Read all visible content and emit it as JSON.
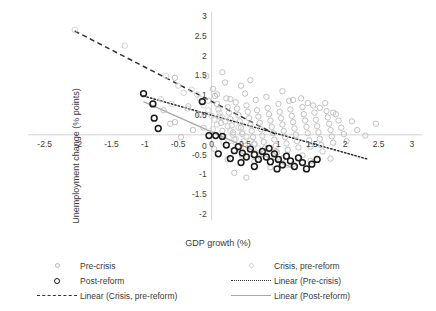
{
  "chart_data": {
    "type": "scatter",
    "title": "",
    "xlabel": "GDP growth (%)",
    "ylabel": "Unemployment change (% points)",
    "xlim": [
      -2.75,
      3.15
    ],
    "ylim": [
      -2.15,
      3.1
    ],
    "xticks": [
      -2.5,
      -2,
      -1.5,
      -1,
      -0.5,
      0,
      0.5,
      1,
      1.5,
      2,
      2.5,
      3
    ],
    "xticklabels": [
      "-2.5",
      "-2",
      "-1.5",
      "-1",
      "-0.5",
      "0",
      "0.5",
      "1",
      "1.5",
      "2",
      "2.5",
      "3"
    ],
    "yticks": [
      -2,
      -1.5,
      -1,
      -0.5,
      0,
      0.5,
      1,
      1.5,
      2,
      2.5,
      3
    ],
    "yticklabels": [
      "-2",
      "-1.5",
      "-1",
      "-0.5",
      "0",
      "0.5",
      "1",
      "1.5",
      "2",
      "2.5",
      "3"
    ],
    "grid": false,
    "legend_position": "below",
    "colors": {
      "pre_crisis": "#b7b7b7",
      "crisis_pre_reform": "#c9c9c9",
      "post_reform": "#1a1a1a",
      "line_crisis_pre_reform": "#333333",
      "line_pre_crisis": "#2b2b2b",
      "line_post_reform": "#a8a8a8",
      "axis": "#c8c8c8"
    },
    "series": [
      {
        "name": "Pre-crisis",
        "marker": "open-circle",
        "color": "#b7b7b7",
        "points": [
          [
            -0.72,
            0.62
          ],
          [
            -0.55,
            0.32
          ],
          [
            -0.35,
            0.72
          ],
          [
            -0.28,
            0.12
          ],
          [
            -0.18,
            0.52
          ],
          [
            -0.12,
            0.18
          ],
          [
            -0.08,
            1.48
          ],
          [
            -0.05,
            0.86
          ],
          [
            0.02,
            1.16
          ],
          [
            0.05,
            0.98
          ],
          [
            0.08,
            0.78
          ],
          [
            0.1,
            0.64
          ],
          [
            0.12,
            0.46
          ],
          [
            0.14,
            0.3
          ],
          [
            0.16,
            0.1
          ],
          [
            0.18,
            -0.04
          ],
          [
            0.2,
            1.32
          ],
          [
            0.22,
            0.92
          ],
          [
            0.24,
            0.7
          ],
          [
            0.26,
            0.56
          ],
          [
            0.28,
            0.4
          ],
          [
            0.3,
            0.24
          ],
          [
            0.32,
            0.06
          ],
          [
            0.34,
            -0.12
          ],
          [
            0.36,
            0.82
          ],
          [
            0.38,
            0.66
          ],
          [
            0.4,
            0.5
          ],
          [
            0.42,
            0.34
          ],
          [
            0.44,
            0.18
          ],
          [
            0.46,
            0.02
          ],
          [
            0.48,
            -0.16
          ],
          [
            0.5,
            1.04
          ],
          [
            0.52,
            0.74
          ],
          [
            0.54,
            0.58
          ],
          [
            0.56,
            0.42
          ],
          [
            0.58,
            0.26
          ],
          [
            0.6,
            0.1
          ],
          [
            0.62,
            -0.06
          ],
          [
            0.64,
            -0.22
          ],
          [
            0.66,
            0.88
          ],
          [
            0.68,
            0.62
          ],
          [
            0.7,
            0.46
          ],
          [
            0.72,
            0.3
          ],
          [
            0.74,
            0.14
          ],
          [
            0.76,
            -0.02
          ],
          [
            0.78,
            -0.18
          ],
          [
            0.8,
            -0.34
          ],
          [
            0.82,
            0.96
          ],
          [
            0.84,
            0.68
          ],
          [
            0.86,
            0.52
          ],
          [
            0.88,
            0.36
          ],
          [
            0.9,
            0.2
          ],
          [
            0.92,
            0.04
          ],
          [
            0.94,
            -0.12
          ],
          [
            0.96,
            -0.28
          ],
          [
            0.98,
            -0.44
          ],
          [
            1.0,
            0.78
          ],
          [
            1.02,
            0.58
          ],
          [
            1.04,
            0.42
          ],
          [
            1.06,
            0.26
          ],
          [
            1.08,
            0.1
          ],
          [
            1.1,
            -0.06
          ],
          [
            1.12,
            -0.22
          ],
          [
            1.14,
            -0.38
          ],
          [
            1.16,
            0.86
          ],
          [
            1.18,
            0.64
          ],
          [
            1.2,
            0.48
          ],
          [
            1.22,
            0.32
          ],
          [
            1.24,
            0.16
          ],
          [
            1.26,
            0.0
          ],
          [
            1.28,
            -0.16
          ],
          [
            1.3,
            -0.32
          ],
          [
            1.34,
            0.92
          ],
          [
            1.36,
            0.7
          ],
          [
            1.38,
            0.52
          ],
          [
            1.4,
            0.36
          ],
          [
            1.42,
            0.2
          ],
          [
            1.44,
            0.04
          ],
          [
            1.46,
            -0.14
          ],
          [
            1.48,
            -0.3
          ],
          [
            1.52,
            0.74
          ],
          [
            1.54,
            0.56
          ],
          [
            1.56,
            0.38
          ],
          [
            1.58,
            0.22
          ],
          [
            1.6,
            0.06
          ],
          [
            1.62,
            -0.1
          ],
          [
            1.64,
            -0.26
          ],
          [
            1.66,
            -0.42
          ],
          [
            1.7,
            0.8
          ],
          [
            1.72,
            0.6
          ],
          [
            1.74,
            0.44
          ],
          [
            1.76,
            0.28
          ],
          [
            1.78,
            0.12
          ],
          [
            1.8,
            -0.04
          ],
          [
            1.82,
            -0.2
          ],
          [
            1.86,
            0.52
          ],
          [
            1.9,
            0.36
          ],
          [
            1.94,
            0.18
          ],
          [
            1.98,
            0.02
          ],
          [
            2.02,
            -0.16
          ],
          [
            2.1,
            0.34
          ],
          [
            2.18,
            0.12
          ],
          [
            2.3,
            -0.02
          ],
          [
            1.78,
            -0.6
          ],
          [
            2.46,
            0.28
          ],
          [
            0.16,
            1.58
          ],
          [
            0.58,
            1.38
          ],
          [
            -0.55,
            1.44
          ],
          [
            -0.62,
            0.28
          ],
          [
            -0.46,
            -0.06
          ],
          [
            0.04,
            -0.36
          ],
          [
            0.46,
            -0.54
          ],
          [
            0.64,
            -0.68
          ],
          [
            0.88,
            -0.82
          ],
          [
            0.34,
            -0.96
          ],
          [
            0.52,
            -1.08
          ],
          [
            1.06,
            -0.6
          ],
          [
            1.22,
            -0.74
          ],
          [
            0.74,
            -0.48
          ],
          [
            0.24,
            -0.62
          ],
          [
            1.36,
            -0.52
          ],
          [
            1.48,
            -0.66
          ],
          [
            0.96,
            -0.42
          ],
          [
            0.08,
            1.02
          ],
          [
            0.44,
            1.24
          ],
          [
            0.28,
            0.9
          ],
          [
            1.06,
            1.1
          ],
          [
            1.22,
            0.88
          ],
          [
            1.44,
            0.8
          ],
          [
            1.62,
            0.68
          ],
          [
            1.82,
            0.56
          ]
        ]
      },
      {
        "name": "Crisis, pre-reform",
        "marker": "open-circle",
        "color": "#c9c9c9",
        "points": [
          [
            -2.05,
            2.65
          ],
          [
            -1.3,
            2.25
          ],
          [
            -0.68,
            1.48
          ],
          [
            -0.5,
            1.24
          ],
          [
            -0.42,
            1.06
          ],
          [
            -0.3,
            1.14
          ],
          [
            -0.18,
            0.92
          ],
          [
            -0.12,
            0.74
          ],
          [
            -0.05,
            0.62
          ],
          [
            0.0,
            0.48
          ],
          [
            0.04,
            0.38
          ],
          [
            0.08,
            0.26
          ],
          [
            0.12,
            0.56
          ],
          [
            0.16,
            0.44
          ],
          [
            0.2,
            0.34
          ],
          [
            0.24,
            0.22
          ],
          [
            0.28,
            0.1
          ],
          [
            0.32,
            0.0
          ],
          [
            0.36,
            -0.1
          ],
          [
            0.4,
            0.18
          ],
          [
            0.46,
            0.06
          ],
          [
            0.52,
            -0.04
          ],
          [
            0.58,
            -0.14
          ],
          [
            0.64,
            -0.24
          ],
          [
            0.7,
            -0.34
          ],
          [
            0.78,
            -0.42
          ],
          [
            0.86,
            -0.52
          ],
          [
            0.94,
            -0.6
          ],
          [
            -0.76,
            0.9
          ],
          [
            -0.6,
            0.78
          ],
          [
            -0.36,
            0.66
          ],
          [
            -0.22,
            1.02
          ],
          [
            0.02,
            0.14
          ],
          [
            0.18,
            -0.18
          ],
          [
            0.3,
            -0.28
          ],
          [
            0.44,
            -0.38
          ],
          [
            0.56,
            -0.48
          ],
          [
            0.74,
            -0.58
          ],
          [
            1.02,
            -0.68
          ],
          [
            1.14,
            -0.76
          ]
        ]
      },
      {
        "name": "Post-reform",
        "marker": "bold-open-circle",
        "color": "#1a1a1a",
        "points": [
          [
            -1.02,
            1.04
          ],
          [
            -0.88,
            0.78
          ],
          [
            -0.86,
            0.42
          ],
          [
            -0.8,
            0.16
          ],
          [
            -0.14,
            0.84
          ],
          [
            -0.04,
            -0.02
          ],
          [
            0.06,
            -0.02
          ],
          [
            0.16,
            -0.04
          ],
          [
            0.22,
            -0.26
          ],
          [
            0.34,
            -0.4
          ],
          [
            0.4,
            -0.3
          ],
          [
            0.46,
            -0.46
          ],
          [
            0.52,
            -0.56
          ],
          [
            0.58,
            -0.36
          ],
          [
            0.64,
            -0.5
          ],
          [
            0.7,
            -0.62
          ],
          [
            0.76,
            -0.42
          ],
          [
            0.82,
            -0.56
          ],
          [
            0.88,
            -0.68
          ],
          [
            0.94,
            -0.48
          ],
          [
            1.0,
            -0.62
          ],
          [
            1.06,
            -0.76
          ],
          [
            1.12,
            -0.54
          ],
          [
            1.18,
            -0.66
          ],
          [
            1.24,
            -0.8
          ],
          [
            1.3,
            -0.58
          ],
          [
            1.36,
            -0.7
          ],
          [
            1.42,
            -0.86
          ],
          [
            0.28,
            -0.6
          ],
          [
            0.1,
            -0.48
          ],
          [
            0.64,
            -0.8
          ],
          [
            0.98,
            -0.86
          ],
          [
            1.5,
            -0.74
          ],
          [
            1.58,
            -0.62
          ],
          [
            0.44,
            -0.7
          ],
          [
            0.86,
            -0.34
          ]
        ]
      }
    ],
    "trendlines": [
      {
        "name": "Linear (Crisis, pre-reform)",
        "style": "dashed",
        "color": "#333333",
        "x0": -2.05,
        "y0": 2.62,
        "x1": 0.95,
        "y1": 0.02
      },
      {
        "name": "Linear (Pre-crisis)",
        "style": "dotted",
        "color": "#2b2b2b",
        "x0": -1.02,
        "y0": 0.98,
        "x1": 2.35,
        "y1": -0.62
      },
      {
        "name": "Linear (Post-reform)",
        "style": "solid",
        "color": "#a8a8a8",
        "x0": -1.02,
        "y0": 0.84,
        "x1": 1.22,
        "y1": -0.84
      }
    ]
  },
  "legend": {
    "entries": [
      {
        "label": "Pre-crisis",
        "key": "marker-pre-crisis"
      },
      {
        "label": "Post-reform",
        "key": "marker-post-reform"
      },
      {
        "label": "Linear (Crisis, pre-reform)",
        "key": "line-dashed"
      },
      {
        "label": "Crisis, pre-reform",
        "key": "marker-crisis-pre-reform"
      },
      {
        "label": "Linear (Pre-crisis)",
        "key": "line-dotted"
      },
      {
        "label": "Linear (Post-reform)",
        "key": "line-solid"
      }
    ]
  }
}
